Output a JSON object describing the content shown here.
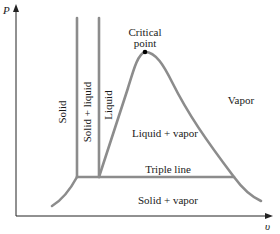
{
  "diagram": {
    "type": "P-v phase diagram",
    "axes": {
      "y_label": "P",
      "x_label": "υ"
    },
    "regions": {
      "solid": "Solid",
      "solid_liquid": "Solid + liquid",
      "liquid": "Liquid",
      "liquid_vapor": "Liquid + vapor",
      "vapor": "Vapor",
      "solid_vapor": "Solid + vapor"
    },
    "annotations": {
      "critical_point_line1": "Critical",
      "critical_point_line2": "point",
      "triple_line": "Triple line"
    },
    "colors": {
      "curve": "#8c8c8c",
      "axis": "#222222",
      "text": "#1a1a1a",
      "critical_point": "#000000"
    }
  }
}
